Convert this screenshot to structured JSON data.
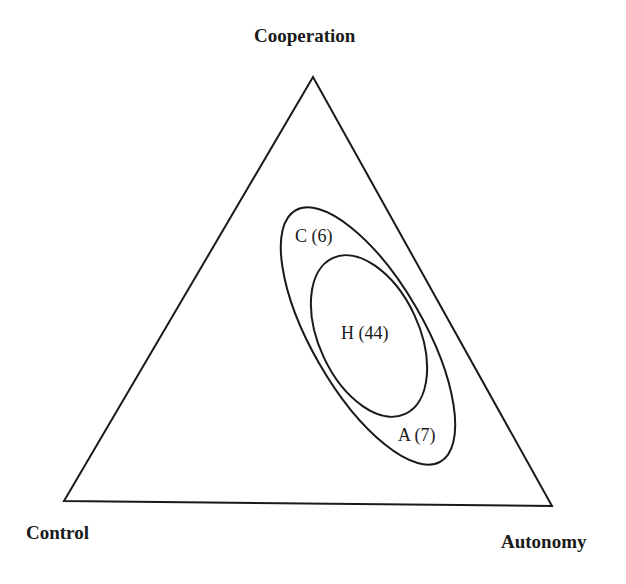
{
  "diagram": {
    "type": "ternary-venn",
    "vertices": {
      "top": "Cooperation",
      "bottom_left": "Control",
      "bottom_right": "Autonomy"
    },
    "groups": [
      {
        "id": "C",
        "label": "C (6)",
        "count": 6
      },
      {
        "id": "H",
        "label": "H (44)",
        "count": 44
      },
      {
        "id": "A",
        "label": "A (7)",
        "count": 7
      }
    ]
  }
}
